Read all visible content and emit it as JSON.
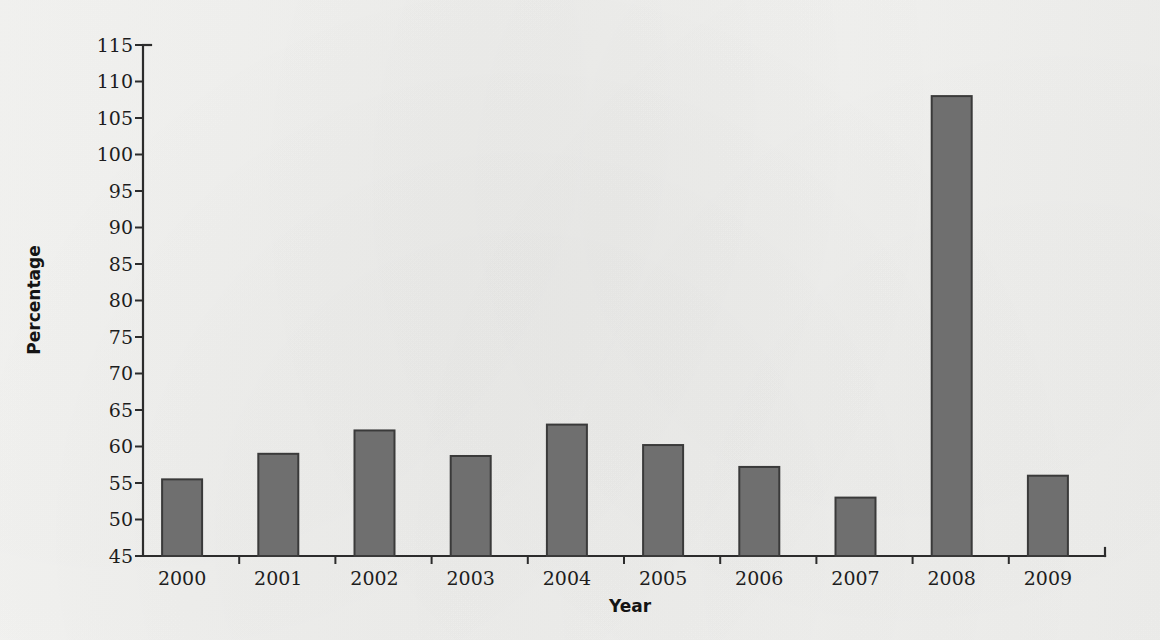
{
  "figure": {
    "background_color": "#f3f3f1",
    "bar_fill_color": "#6f6f6f",
    "bar_edge_color": "#3a3a3a",
    "axis_color": "#2c2c2c"
  },
  "chart_data": {
    "type": "bar",
    "title": "",
    "xlabel": "Year",
    "ylabel": "Percentage",
    "categories": [
      "2000",
      "2001",
      "2002",
      "2003",
      "2004",
      "2005",
      "2006",
      "2007",
      "2008",
      "2009"
    ],
    "values": [
      55.5,
      59.0,
      62.2,
      58.7,
      63.0,
      60.2,
      57.2,
      53.0,
      108.0,
      56.0
    ],
    "ylim": [
      45,
      115
    ],
    "ytick_step": 5,
    "yticks": [
      45,
      50,
      55,
      60,
      65,
      70,
      75,
      80,
      85,
      90,
      95,
      100,
      105,
      110,
      115
    ],
    "ytick_labels": [
      "45",
      "50",
      "55",
      "60",
      "65",
      "70",
      "75",
      "80",
      "85",
      "90",
      "95",
      "100",
      "105",
      "110",
      "115"
    ],
    "grid": false,
    "legend": null,
    "legend_position": "none",
    "annotations": []
  }
}
